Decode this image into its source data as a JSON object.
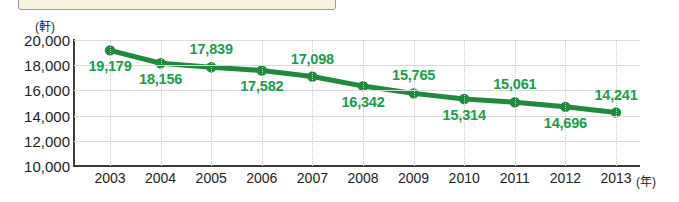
{
  "banner": {
    "name": "cream-banner-strip",
    "color": "#f7f5dd"
  },
  "axis": {
    "y_unit": "(軒)",
    "x_unit": "(年)"
  },
  "colors": {
    "line": "#1f8a3d",
    "marker": "#1f8a3d",
    "label_text": "#18a04a",
    "axis": "#3b3b3b",
    "grid": "#dcdcdc",
    "banner": "#f7f5dd"
  },
  "chart_data": {
    "type": "line",
    "title": "",
    "xlabel": "(年)",
    "ylabel": "(軒)",
    "ylim": [
      10000,
      20000
    ],
    "yticks": [
      "10,000",
      "12,000",
      "14,000",
      "16,000",
      "18,000",
      "20,000"
    ],
    "ytick_values": [
      10000,
      12000,
      14000,
      16000,
      18000,
      20000
    ],
    "grid": true,
    "legend": null,
    "categories": [
      "2003",
      "2004",
      "2005",
      "2006",
      "2007",
      "2008",
      "2009",
      "2010",
      "2011",
      "2012",
      "2013"
    ],
    "values": [
      19179,
      18156,
      17839,
      17582,
      17098,
      16342,
      15765,
      15314,
      15061,
      14696,
      14241
    ],
    "point_labels": [
      "19,179",
      "18,156",
      "17,839",
      "17,582",
      "17,098",
      "16,342",
      "15,765",
      "15,314",
      "15,061",
      "14,696",
      "14,241"
    ],
    "label_positions": [
      "below",
      "below",
      "above",
      "below",
      "above",
      "below",
      "above",
      "below",
      "above",
      "below",
      "above"
    ],
    "series": [
      {
        "name": "",
        "values": [
          19179,
          18156,
          17839,
          17582,
          17098,
          16342,
          15765,
          15314,
          15061,
          14696,
          14241
        ]
      }
    ]
  }
}
